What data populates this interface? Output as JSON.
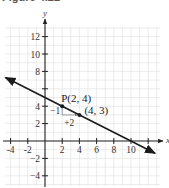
{
  "title": "Figure 4.22",
  "chart_data": {
    "type": "line",
    "title": "Figure 4.22",
    "xlabel": "x",
    "ylabel": "y",
    "xlim": [
      -4.6,
      13.5
    ],
    "ylim": [
      -5.2,
      13.5
    ],
    "grid": true,
    "x_ticks": [
      -4,
      -2,
      2,
      4,
      6,
      8,
      10,
      12
    ],
    "x_tick_labels": [
      "-4",
      "-2",
      "2",
      "4",
      "6",
      "8",
      "10",
      ""
    ],
    "y_ticks": [
      -4,
      -2,
      2,
      4,
      6,
      8,
      10,
      12
    ],
    "y_tick_labels": [
      "−4",
      "−2",
      "2",
      "4",
      "",
      "8",
      "10",
      "12"
    ],
    "series": [
      {
        "name": "line",
        "equation": "y = -x/2 + 5",
        "slope": -0.5,
        "intercept": 5,
        "x": [
          -4.6,
          12.8
        ],
        "y": [
          7.3,
          -1.4
        ],
        "arrows_both_ends": true
      }
    ],
    "points": [
      {
        "label": "P(2, 4)",
        "x": 2,
        "y": 4
      },
      {
        "label": "(4, 3)",
        "x": 4,
        "y": 3
      }
    ],
    "annotations": [
      {
        "text": "−1",
        "meaning": "rise",
        "x": 2,
        "y": 3.5
      },
      {
        "text": "+2",
        "meaning": "run",
        "x": 3,
        "y": 2.6
      }
    ]
  },
  "colors": {
    "grid": "#e4e4e4",
    "axis": "#222222",
    "line": "#1a1a1a",
    "text": "#333333"
  }
}
